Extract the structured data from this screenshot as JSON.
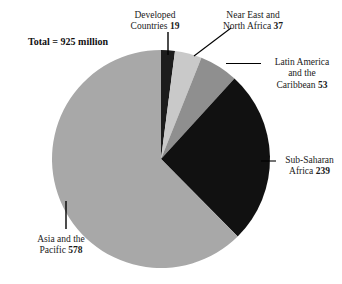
{
  "title_note": {
    "text": "Total = 925 million"
  },
  "chart_data": {
    "type": "pie",
    "title": "",
    "subtitle": "",
    "total": 925,
    "units": "million",
    "total_label": "Total = 925 million",
    "legend_position": "callout-labels",
    "start_angle_deg": 0,
    "direction": "clockwise",
    "categories": [
      "Developed Countries",
      "Near East and North Africa",
      "Latin America and the Caribbean",
      "Sub-Saharan Africa",
      "Asia and the Pacific"
    ],
    "values": [
      19,
      37,
      53,
      239,
      578
    ],
    "colors": [
      "#1c1c1c",
      "#c9c9c9",
      "#8f8f8f",
      "#111111",
      "#a8a8a8"
    ],
    "slices": [
      {
        "name": "Developed Countries",
        "label_line1": "Developed",
        "label_line2": "Countries",
        "value": 19,
        "value_text": "19",
        "color": "#1c1c1c",
        "percent": "2.1"
      },
      {
        "name": "Near East and North Africa",
        "label_line1": "Near East and",
        "label_line2": "North Africa",
        "value": 37,
        "value_text": "37",
        "color": "#c9c9c9",
        "percent": "4.0"
      },
      {
        "name": "Latin America and the Caribbean",
        "label_line1": "Latin America",
        "label_line2": "and the",
        "label_line3": "Caribbean",
        "value": 53,
        "value_text": "53",
        "color": "#8f8f8f",
        "percent": "5.7"
      },
      {
        "name": "Sub-Saharan Africa",
        "label_line1": "Sub-Saharan",
        "label_line2": "Africa",
        "value": 239,
        "value_text": "239",
        "color": "#111111",
        "percent": "25.8"
      },
      {
        "name": "Asia and the Pacific",
        "label_line1": "Asia and the",
        "label_line2": "Pacific",
        "value": 578,
        "value_text": "578",
        "color": "#a8a8a8",
        "percent": "62.5"
      }
    ]
  }
}
